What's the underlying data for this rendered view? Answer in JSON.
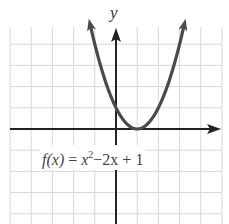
{
  "chart_data": {
    "type": "line",
    "title": "",
    "function_label": "f(x) = x^2 - 2x + 1",
    "function_label_parts": {
      "lhs": "f(x)",
      "eq": " = ",
      "x_term": "x",
      "exp": "2",
      "rest": "−2x + 1"
    },
    "xlabel": "",
    "ylabel": "y",
    "xlim": [
      -5,
      5
    ],
    "ylim": [
      -4.5,
      4.8
    ],
    "grid": true,
    "grid_step": 1,
    "series": [
      {
        "name": "f(x) = x^2 - 2x + 1",
        "x": [
          -1.3,
          -1,
          -0.5,
          0,
          0.5,
          1,
          1.5,
          2,
          2.5,
          3,
          3.3
        ],
        "y": [
          5.29,
          4,
          2.25,
          1,
          0.25,
          0,
          0.25,
          1,
          2.25,
          4,
          5.29
        ]
      }
    ],
    "vertex": [
      1,
      0
    ],
    "y_intercept": [
      0,
      1
    ],
    "colors": {
      "grid": "#d8d8d8",
      "axes": "#222222",
      "curve": "#4a4a4a"
    }
  }
}
